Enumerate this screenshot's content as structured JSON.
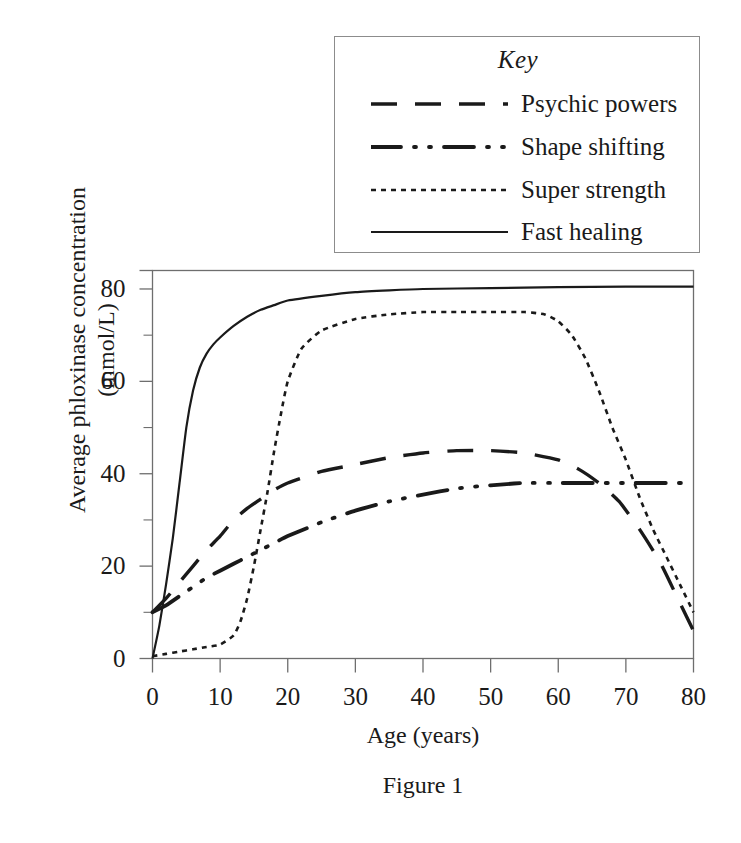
{
  "figure": {
    "caption": "Figure 1",
    "x_axis_title": "Age (years)",
    "y_axis_title_line1": "Average phloxinase concentration",
    "y_axis_title_line2": "(mmol/L)",
    "line_color": "#1a1a1a",
    "axis_color": "#6e6e6e",
    "background": "#ffffff"
  },
  "legend": {
    "title": "Key",
    "items": [
      {
        "label": "Psychic powers",
        "style": "long-dash",
        "dash": "26,18",
        "width": 3.4
      },
      {
        "label": "Shape shifting",
        "style": "dash-dot-dot",
        "dash": "30,13,2,13,2,13",
        "width": 3.8
      },
      {
        "label": "Super strength",
        "style": "dotted",
        "dash": "5,5",
        "width": 2.6
      },
      {
        "label": "Fast healing",
        "style": "solid",
        "dash": "none",
        "width": 2.2
      }
    ]
  },
  "chart_data": {
    "type": "line",
    "title": "",
    "xlabel": "Age (years)",
    "ylabel": "Average phloxinase concentration (mmol/L)",
    "xlim": [
      0,
      80
    ],
    "ylim": [
      0,
      84
    ],
    "xticks": [
      0,
      10,
      20,
      30,
      40,
      50,
      60,
      70,
      80
    ],
    "yticks": [
      0,
      20,
      40,
      60,
      80
    ],
    "x_minor_tick_interval": 5,
    "y_minor_tick_interval": 10,
    "grid": false,
    "legend_position": "above-plot",
    "series": [
      {
        "name": "Psychic powers",
        "style": "long-dash",
        "x": [
          0,
          2,
          4,
          6,
          8,
          10,
          12,
          14,
          16,
          18,
          20,
          25,
          30,
          35,
          40,
          45,
          50,
          55,
          60,
          63,
          66,
          69,
          72,
          75,
          78,
          80
        ],
        "y": [
          10,
          13,
          16.5,
          20,
          23.5,
          26.5,
          30,
          32.5,
          34.5,
          36.5,
          38,
          40.5,
          42,
          43.5,
          44.5,
          45,
          45,
          44.5,
          43,
          41,
          38,
          34,
          28,
          21,
          12,
          6
        ]
      },
      {
        "name": "Shape shifting",
        "style": "dash-dot-dot",
        "x": [
          0,
          2,
          4,
          6,
          8,
          10,
          12,
          14,
          16,
          18,
          20,
          25,
          30,
          35,
          40,
          45,
          50,
          55,
          60,
          65,
          70,
          75,
          80
        ],
        "y": [
          10,
          11.5,
          13.5,
          15.5,
          17.5,
          19,
          20.5,
          22,
          23.5,
          25,
          26.5,
          29.5,
          32,
          34,
          35.5,
          36.8,
          37.5,
          38,
          38,
          38,
          38,
          38,
          38
        ]
      },
      {
        "name": "Super strength",
        "style": "dotted",
        "x": [
          0,
          2,
          4,
          6,
          8,
          10,
          12,
          13,
          14,
          15,
          16,
          17,
          18,
          19,
          20,
          22,
          25,
          30,
          35,
          40,
          45,
          50,
          55,
          58,
          60,
          62,
          64,
          66,
          68,
          70,
          72,
          74,
          76,
          78,
          80
        ],
        "y": [
          0.5,
          1,
          1.5,
          2,
          2.5,
          3,
          5,
          8,
          13,
          20,
          28,
          36,
          45,
          53,
          60,
          67,
          71,
          73.5,
          74.5,
          75,
          75,
          75,
          75,
          74.5,
          73,
          70,
          65,
          58,
          50,
          43,
          35,
          28,
          22,
          16,
          10
        ]
      },
      {
        "name": "Fast healing",
        "style": "solid",
        "x": [
          0,
          1,
          2,
          3,
          4,
          5,
          6,
          7,
          8,
          9,
          10,
          12,
          14,
          16,
          18,
          20,
          25,
          30,
          35,
          40,
          50,
          60,
          70,
          80
        ],
        "y": [
          0,
          7,
          16,
          26,
          38,
          50,
          58,
          63,
          66,
          68,
          69.5,
          72,
          74,
          75.5,
          76.5,
          77.5,
          78.5,
          79.3,
          79.7,
          80,
          80.2,
          80.4,
          80.5,
          80.5
        ]
      }
    ]
  },
  "axis_tick_labels": {
    "x": [
      "0",
      "10",
      "20",
      "30",
      "40",
      "50",
      "60",
      "70",
      "80"
    ],
    "y": [
      "0",
      "20",
      "40",
      "60",
      "80"
    ]
  }
}
